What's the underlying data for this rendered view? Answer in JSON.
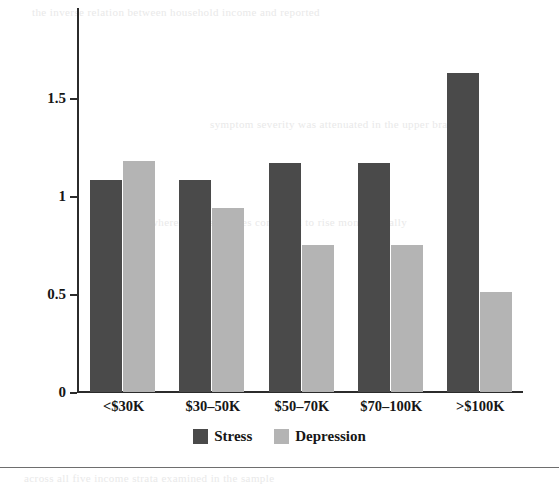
{
  "chart_data": {
    "type": "bar",
    "title": "",
    "subtitle": "",
    "xlabel": "",
    "ylabel": "",
    "categories": [
      "<$30K",
      "$30–50K",
      "$50–70K",
      "$70–100K",
      ">$100K"
    ],
    "series": [
      {
        "name": "Stress",
        "color": "#4a4a4a",
        "values": [
          1.08,
          1.08,
          1.17,
          1.17,
          1.63
        ]
      },
      {
        "name": "Depression",
        "color": "#b4b4b4",
        "values": [
          1.18,
          0.94,
          0.75,
          0.75,
          0.51
        ]
      }
    ],
    "ylim": [
      0,
      1.75
    ],
    "yticks": [
      0,
      0.5,
      1,
      1.5
    ],
    "ytick_labels": [
      "0",
      "0.5",
      "1",
      "1.5"
    ],
    "grid": false,
    "legend_position": "bottom-center",
    "axis_color": "#2b2b2b"
  },
  "legend": {
    "entries": [
      {
        "label": "Stress",
        "swatch": "stress"
      },
      {
        "label": "Depression",
        "swatch": "depression"
      }
    ]
  },
  "bleed_text": [
    "the  inverse  relation  between  household  income  and  reported",
    "symptom  severity  was  attenuated  in  the  upper  brackets",
    "whereas  stress  scores  continued  to  rise  monotonically",
    "across  all  five  income  strata  examined  in  the  sample"
  ]
}
